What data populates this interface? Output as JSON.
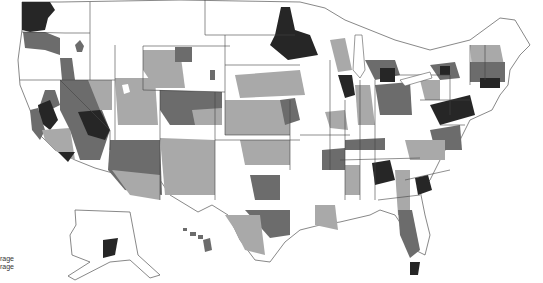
{
  "map": {
    "type": "choropleth",
    "region": "United States",
    "shading": {
      "none": "#ffffff",
      "light": "#a9a9a9",
      "medium": "#6c6c6c",
      "dark": "#262626"
    }
  },
  "legend": {
    "items": [
      {
        "label": "rage"
      },
      {
        "label": "rage"
      }
    ]
  }
}
